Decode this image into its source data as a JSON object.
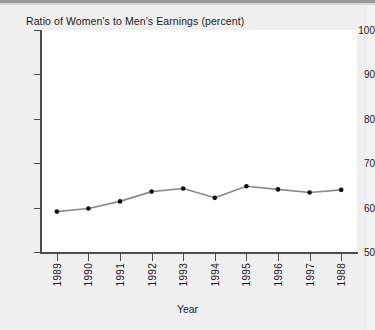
{
  "chart_data": {
    "type": "line",
    "title": "Ratio of Women's to Men's Earnings (percent)",
    "xlabel": "Year",
    "ylabel": "",
    "categories": [
      "1989",
      "1990",
      "1991",
      "1992",
      "1993",
      "1994",
      "1995",
      "1996",
      "1997",
      "1988"
    ],
    "values": [
      59.1,
      59.8,
      61.4,
      63.6,
      64.3,
      62.2,
      64.8,
      64.1,
      63.4,
      64.0
    ],
    "ylim": [
      50,
      100
    ],
    "yticks": [
      50,
      60,
      70,
      80,
      90,
      100
    ],
    "ytick_labels": [
      "50",
      "60",
      "70",
      "80",
      "90",
      "100"
    ],
    "grid": false,
    "legend": "none",
    "series": [
      {
        "name": "Ratio of Women's to Men's Earnings (percent)",
        "values": [
          59.1,
          59.8,
          61.4,
          63.6,
          64.3,
          62.2,
          64.8,
          64.1,
          63.4,
          64.0
        ]
      }
    ],
    "marker": "filled-circle",
    "line_color": "#8a8a8a",
    "marker_color": "#111111",
    "plot_background": "#ffffff",
    "figure_background": "#efefef"
  }
}
